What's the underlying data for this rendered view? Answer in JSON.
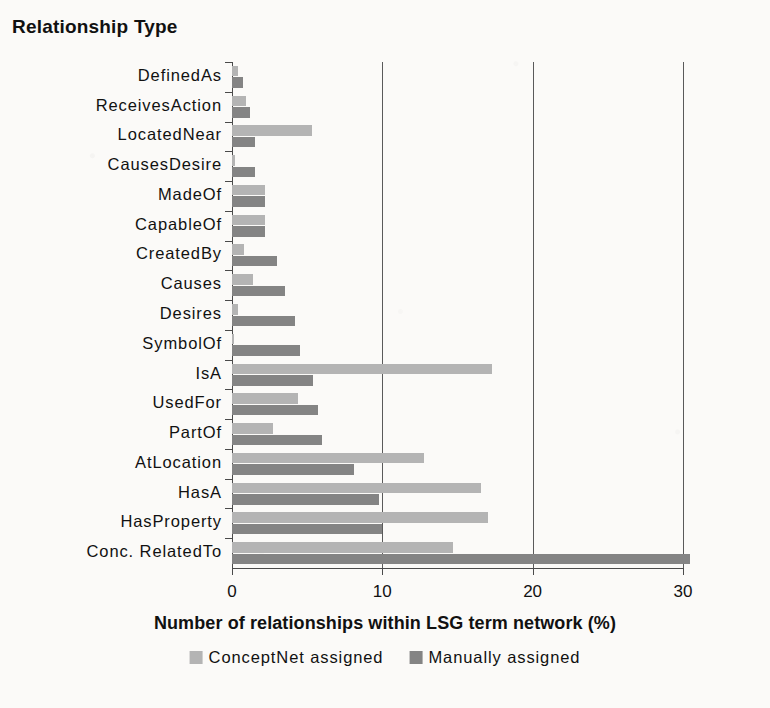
{
  "chart_data": {
    "type": "bar",
    "orientation": "horizontal",
    "title": "",
    "ylabel": "Relationship Type",
    "xlabel": "Number of relationships within LSG term network (%)",
    "xlim": [
      0,
      30.1
    ],
    "xticks": [
      0,
      10,
      20,
      30
    ],
    "xtick_labels": [
      "0",
      "10",
      "20",
      "30"
    ],
    "grid": "vertical gridlines at 10 and 20",
    "legend_position": "bottom-center",
    "categories": [
      "DefinedAs",
      "ReceivesAction",
      "LocatedNear",
      "CausesDesire",
      "MadeOf",
      "CapableOf",
      "CreatedBy",
      "Causes",
      "Desires",
      "SymbolOf",
      "IsA",
      "UsedFor",
      "PartOf",
      "AtLocation",
      "HasA",
      "HasProperty",
      "Conc. RelatedTo"
    ],
    "series": [
      {
        "name": "ConceptNet assigned",
        "color": "#b4b4b4",
        "values": [
          0.4,
          0.9,
          5.3,
          0.2,
          2.2,
          2.2,
          0.8,
          1.4,
          0.4,
          0.1,
          17.3,
          4.4,
          2.7,
          12.8,
          16.6,
          17.0,
          14.7
        ]
      },
      {
        "name": "Manually assigned",
        "color": "#848484",
        "values": [
          0.7,
          1.2,
          1.5,
          1.5,
          2.2,
          2.2,
          3.0,
          3.5,
          4.2,
          4.5,
          5.4,
          5.7,
          6.0,
          8.1,
          9.8,
          10.0,
          30.5
        ]
      }
    ]
  },
  "axis": {
    "y_title": "Relationship Type",
    "x_title": "Number of relationships within LSG term network (%)"
  },
  "legend": {
    "items": [
      {
        "label": "ConceptNet assigned",
        "color": "#b4b4b4"
      },
      {
        "label": "Manually assigned",
        "color": "#848484"
      }
    ]
  },
  "colors": {
    "background": "#fbfaf8",
    "axis": "#4a4a4a",
    "text": "#111111",
    "series_light": "#b4b4b4",
    "series_dark": "#848484"
  }
}
